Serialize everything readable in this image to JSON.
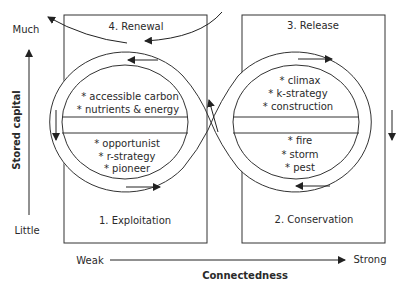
{
  "diagram": {
    "type": "adaptive-cycle",
    "phases": [
      {
        "id": "exploitation",
        "label": "1. Exploitation"
      },
      {
        "id": "conservation",
        "label": "2. Conservation"
      },
      {
        "id": "release",
        "label": "3. Release"
      },
      {
        "id": "renewal",
        "label": "4. Renewal"
      }
    ],
    "left_loop": {
      "upper_items": [
        "* accessible carbon",
        "* nutrients & energy"
      ],
      "lower_items": [
        "* opportunist",
        "* r-strategy",
        "* pioneer"
      ]
    },
    "right_loop": {
      "upper_items": [
        "* climax",
        "* k-strategy",
        "* construction"
      ],
      "lower_items": [
        "* fire",
        "* storm",
        "* pest"
      ]
    },
    "y_axis": {
      "title": "Stored capital",
      "high": "Much",
      "low": "Little"
    },
    "x_axis": {
      "title": "Connectedness",
      "low": "Weak",
      "high": "Strong"
    },
    "colors": {
      "line": "#333333",
      "text": "#2a2a2a",
      "background": "#ffffff"
    }
  }
}
